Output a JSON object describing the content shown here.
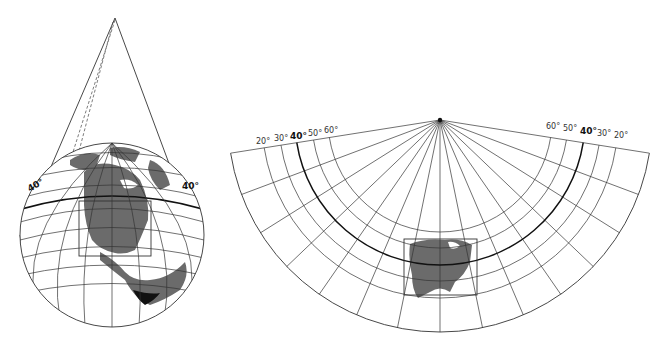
{
  "figure": {
    "colors": {
      "line": "#333333",
      "land": "#6b6b6b",
      "bold_line": "#111111",
      "dark_land": "#111111",
      "background": "#ffffff"
    }
  },
  "globe": {
    "labels": {
      "left_parallel": "40°",
      "right_parallel": "40°"
    }
  },
  "fan": {
    "labels_left": [
      "20°",
      "30°",
      "40°",
      "50°",
      "60°"
    ],
    "labels_right": [
      "60°",
      "50°",
      "40°",
      "30°",
      "20°"
    ],
    "standard_parallel": "40°"
  }
}
